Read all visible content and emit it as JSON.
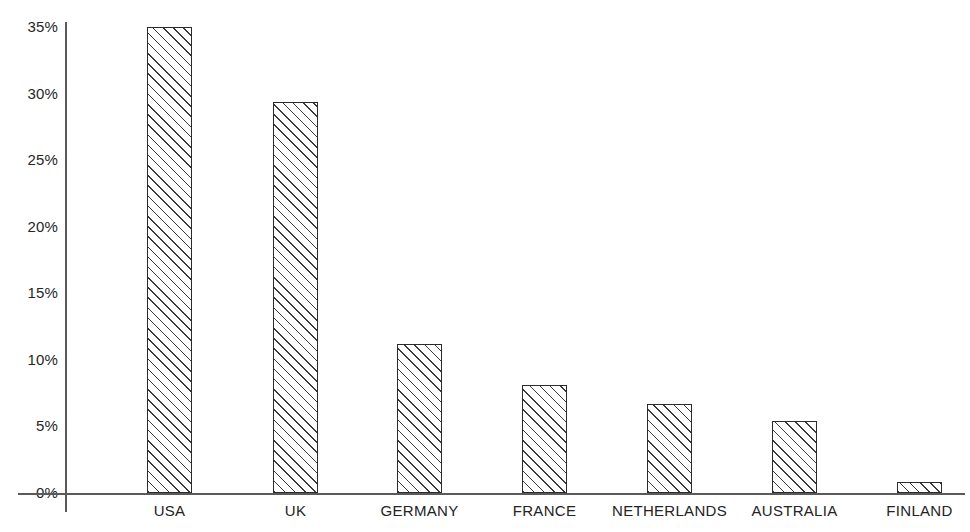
{
  "chart_data": {
    "type": "bar",
    "title": "",
    "subtitle": "",
    "xlabel": "",
    "ylabel": "",
    "categories": [
      "USA",
      "UK",
      "GERMANY",
      "FRANCE",
      "NETHERLANDS",
      "AUSTRALIA",
      "FINLAND"
    ],
    "values": [
      35.0,
      29.4,
      11.2,
      8.1,
      6.7,
      5.4,
      0.8
    ],
    "value_suffix": "%",
    "ylim": [
      0,
      36.5
    ],
    "ytick_labels": [
      "35%",
      "30%",
      "25%",
      "20%",
      "15%",
      "10%",
      "5%",
      "0%"
    ],
    "ytick_values": [
      35,
      30,
      25,
      20,
      15,
      10,
      5,
      0
    ],
    "grid": false,
    "legend": null,
    "legend_position": "none",
    "annotations": [],
    "colors": {
      "bar_fill": "#ffffff",
      "bar_edge": "#2b2b2b",
      "hatch": "#3a3a3a",
      "axis": "#5a5a5a",
      "text": "#232323",
      "background": "#ffffff"
    },
    "hatch_pattern": "forward-diagonal"
  },
  "geometry": {
    "baseline_y": 493,
    "top_y": 27,
    "axis_x": 65,
    "bar_width": 45,
    "bar_left_positions": [
      147,
      273,
      397,
      522,
      647,
      772,
      897
    ],
    "ytick_y_positions": [
      27,
      93,
      160,
      227,
      293,
      360,
      427,
      493
    ]
  }
}
